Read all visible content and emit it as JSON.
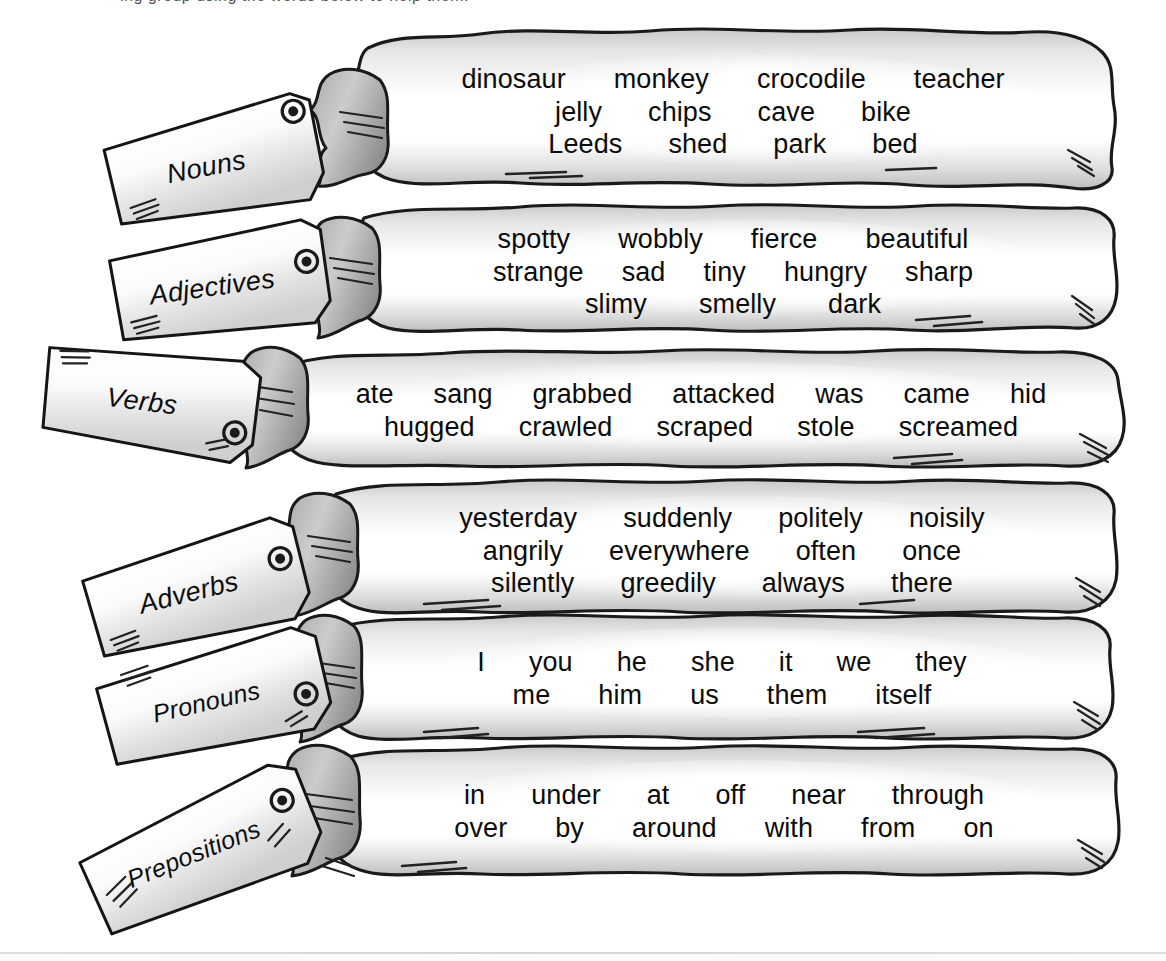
{
  "page": {
    "top_cut_text": "ing group using the words below to help them.",
    "background_color": "#ffffff",
    "ink_color": "#0b0b0b",
    "wash_color": "#b9b9b9"
  },
  "sacks": [
    {
      "id": "nouns",
      "tag_label": "Nouns",
      "rows": [
        [
          "dinosaur",
          "monkey",
          "crocodile",
          "teacher"
        ],
        [
          "jelly",
          "chips",
          "cave",
          "bike"
        ],
        [
          "Leeds",
          "shed",
          "park",
          "bed"
        ]
      ]
    },
    {
      "id": "adjectives",
      "tag_label": "Adjectives",
      "rows": [
        [
          "spotty",
          "wobbly",
          "fierce",
          "beautiful"
        ],
        [
          "strange",
          "sad",
          "tiny",
          "hungry",
          "sharp"
        ],
        [
          "slimy",
          "smelly",
          "dark"
        ]
      ]
    },
    {
      "id": "verbs",
      "tag_label": "Verbs",
      "rows": [
        [
          "ate",
          "sang",
          "grabbed",
          "attacked",
          "was",
          "came",
          "hid"
        ],
        [
          "hugged",
          "crawled",
          "scraped",
          "stole",
          "screamed"
        ]
      ]
    },
    {
      "id": "adverbs",
      "tag_label": "Adverbs",
      "rows": [
        [
          "yesterday",
          "suddenly",
          "politely",
          "noisily"
        ],
        [
          "angrily",
          "everywhere",
          "often",
          "once"
        ],
        [
          "silently",
          "greedily",
          "always",
          "there"
        ]
      ]
    },
    {
      "id": "pronouns",
      "tag_label": "Pronouns",
      "rows": [
        [
          "I",
          "you",
          "he",
          "she",
          "it",
          "we",
          "they"
        ],
        [
          "me",
          "him",
          "us",
          "them",
          "itself"
        ]
      ]
    },
    {
      "id": "prepositions",
      "tag_label": "Prepositions",
      "rows": [
        [
          "in",
          "under",
          "at",
          "off",
          "near",
          "through"
        ],
        [
          "over",
          "by",
          "around",
          "with",
          "from",
          "on"
        ]
      ]
    }
  ]
}
